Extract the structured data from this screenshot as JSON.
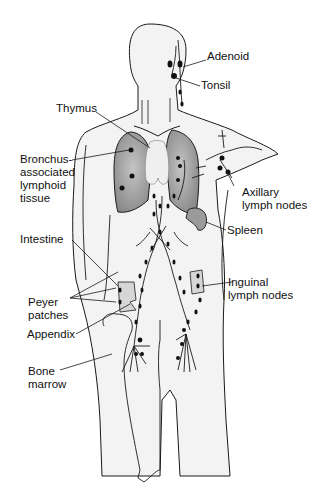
{
  "figure": {
    "labels": {
      "adenoid": "Adenoid",
      "tonsil": "Tonsil",
      "thymus": "Thymus",
      "balt_1": "Bronchus-",
      "balt_2": "associated",
      "balt_3": "lymphoid",
      "balt_4": "tissue",
      "axillary_1": "Axillary",
      "axillary_2": "lymph nodes",
      "spleen": "Spleen",
      "intestine": "Intestine",
      "inguinal_1": "Inguinal",
      "inguinal_2": "lymph nodes",
      "peyer_1": "Peyer",
      "peyer_2": "patches",
      "appendix": "Appendix",
      "bone_1": "Bone",
      "bone_2": "marrow"
    },
    "colors": {
      "outline": "#1a1a1a",
      "lung_fill": "#8c8c8c",
      "lung_light": "#c8c8c8",
      "body_fill": "#f2f2f2",
      "node_fill": "#111111",
      "thymus_fill": "#eeeeee"
    }
  }
}
